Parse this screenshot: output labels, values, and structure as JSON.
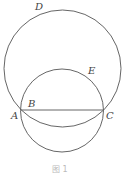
{
  "figure": {
    "caption": "图 1",
    "points": {
      "A": {
        "label": "A",
        "x": 21,
        "y": 110
      },
      "B": {
        "label": "B",
        "x": 26,
        "y": 110
      },
      "C": {
        "label": "C",
        "x": 103,
        "y": 110
      },
      "D": {
        "label": "D",
        "x": 38,
        "y": 8
      },
      "E": {
        "label": "E",
        "x": 89,
        "y": 71
      }
    },
    "circles": [
      {
        "name": "large-circle",
        "cx": 62.5,
        "cy": 68.5,
        "r": 58.5
      },
      {
        "name": "small-circle",
        "cx": 62,
        "cy": 110.5,
        "r": 41.5
      }
    ],
    "segments": [
      {
        "name": "segment-AC",
        "from": "A",
        "to": "C"
      }
    ],
    "stroke_color": "#555555"
  }
}
